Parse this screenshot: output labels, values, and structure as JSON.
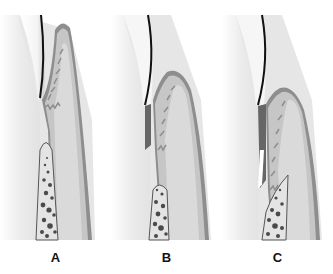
{
  "figure": {
    "colors": {
      "tooth_outline": "#111111",
      "gingiva_outer": "#8e8e8e",
      "gingiva_fill": "#c6c6c6",
      "connective_tissue": "#dadada",
      "bone_fill": "#e4e4e4",
      "bone_marrow": "#4a4a4a",
      "background": "#ffffff"
    },
    "panels": [
      {
        "label": "A",
        "stage": "normal-sulcus"
      },
      {
        "label": "B",
        "stage": "gingival-pocket"
      },
      {
        "label": "C",
        "stage": "periodontal-pocket"
      }
    ]
  }
}
